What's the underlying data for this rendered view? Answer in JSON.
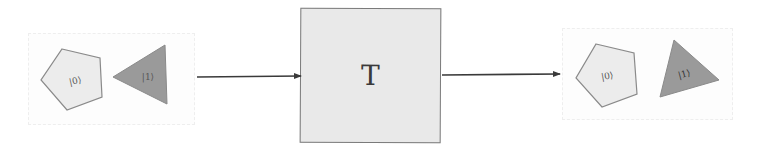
{
  "diagram": {
    "type": "state-transformation",
    "operator": {
      "label": "T",
      "fill": "#e9e9e9",
      "stroke": "#7a7a7a"
    },
    "input_state": {
      "shapes": [
        {
          "kind": "pentagon",
          "label": "|0⟩",
          "fill": "#ececec",
          "stroke": "#8a8a8a"
        },
        {
          "kind": "triangle",
          "label": "|1⟩",
          "fill": "#9a9a9a",
          "stroke": "#8a8a8a"
        }
      ]
    },
    "output_state": {
      "shapes": [
        {
          "kind": "pentagon",
          "label": "|0⟩",
          "fill": "#ececec",
          "stroke": "#8a8a8a"
        },
        {
          "kind": "triangle",
          "label": "|1⟩",
          "fill": "#9a9a9a",
          "stroke": "#8a8a8a"
        }
      ]
    },
    "arrows": [
      {
        "from": "input_state",
        "to": "operator"
      },
      {
        "from": "operator",
        "to": "output_state"
      }
    ],
    "colors": {
      "arrow": "#3a3a3a",
      "background": "#ffffff"
    }
  }
}
